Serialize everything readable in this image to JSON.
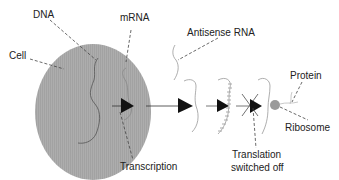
{
  "diagram": {
    "labels": {
      "dna": "DNA",
      "mrna": "mRNA",
      "cell": "Cell",
      "antisense": "Antisense RNA",
      "protein": "Protein",
      "ribosome": "Ribosome",
      "transcription": "Transcription",
      "translation_line1": "Translation",
      "translation_line2": "switched off"
    },
    "colors": {
      "cell_fill": "#a9a9a9",
      "strand": "#8a8a8a",
      "arrow": "#111111",
      "ribosome": "#999999",
      "text": "#222222"
    }
  }
}
